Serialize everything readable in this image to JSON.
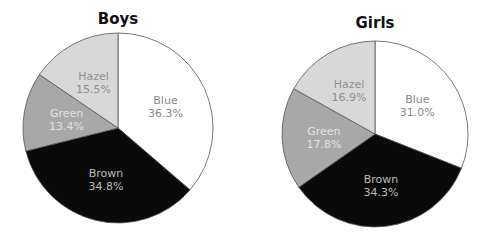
{
  "chart_data": [
    {
      "type": "pie",
      "title": "Boys",
      "center": [
        118,
        128
      ],
      "radius": 95,
      "slices": [
        {
          "label": "Blue",
          "value": 36.3,
          "display": "36.3%",
          "fill": "#ffffff",
          "text": "#888888"
        },
        {
          "label": "Brown",
          "value": 34.8,
          "display": "34.8%",
          "fill": "#0a0a0a",
          "text": "#bbbbbb"
        },
        {
          "label": "Green",
          "value": 13.4,
          "display": "13.4%",
          "fill": "#a8a8a8",
          "text": "#e0e0e0"
        },
        {
          "label": "Hazel",
          "value": 15.5,
          "display": "15.5%",
          "fill": "#d8d8d8",
          "text": "#909090"
        }
      ]
    },
    {
      "type": "pie",
      "title": "Girls",
      "center": [
        375,
        134
      ],
      "radius": 93,
      "slices": [
        {
          "label": "Blue",
          "value": 31.0,
          "display": "31.0%",
          "fill": "#ffffff",
          "text": "#888888"
        },
        {
          "label": "Brown",
          "value": 34.3,
          "display": "34.3%",
          "fill": "#0a0a0a",
          "text": "#bbbbbb"
        },
        {
          "label": "Green",
          "value": 17.8,
          "display": "17.8%",
          "fill": "#a8a8a8",
          "text": "#e0e0e0"
        },
        {
          "label": "Hazel",
          "value": 16.9,
          "display": "16.9%",
          "fill": "#d8d8d8",
          "text": "#909090"
        }
      ]
    }
  ]
}
